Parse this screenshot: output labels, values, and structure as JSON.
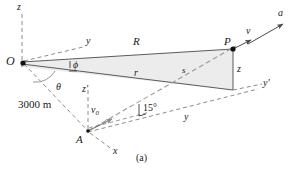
{
  "figure": {
    "caption": "(a)",
    "type": "vector-kinematics-diagram",
    "points": {
      "origin_label": "O",
      "target_label": "P",
      "launch_label": "A"
    },
    "axes": [
      {
        "name": "z-axis-label",
        "text": "z"
      },
      {
        "name": "y-axis-label",
        "text": "y"
      },
      {
        "name": "z-prime-axis-label",
        "text": "z'"
      },
      {
        "name": "y-prime-axis-label",
        "text": "y'"
      },
      {
        "name": "x-axis-label",
        "text": "x"
      },
      {
        "name": "y-ground-label",
        "text": "y"
      },
      {
        "name": "z-height-label",
        "text": "z"
      }
    ],
    "vectors": [
      {
        "name": "range-vector-R",
        "text": "R"
      },
      {
        "name": "position-vector-r",
        "text": "r"
      },
      {
        "name": "displacement-s",
        "text": "s"
      },
      {
        "name": "velocity-v",
        "text": "v"
      },
      {
        "name": "acceleration-a",
        "text": "a"
      },
      {
        "name": "initial-velocity",
        "text": "v",
        "subscript": "0"
      }
    ],
    "angles": [
      {
        "name": "phi-angle",
        "text": "ϕ"
      },
      {
        "name": "theta-angle",
        "text": "θ"
      },
      {
        "name": "launch-angle",
        "text": "15",
        "unit": "°"
      }
    ],
    "dimensions": [
      {
        "name": "distance-OA",
        "text": "3000 m"
      }
    ],
    "colors": {
      "line": "#3a3a3a",
      "dashed": "#8c8c8c",
      "fill": "#e9e9e9",
      "text": "#1a1a1a"
    }
  }
}
